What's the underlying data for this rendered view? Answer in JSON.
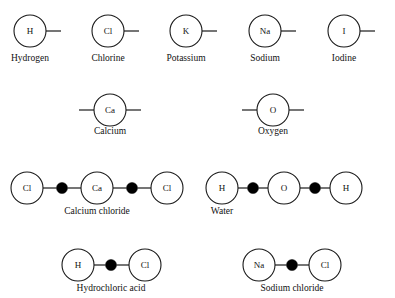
{
  "page": {
    "background_color": "#ffffff",
    "stroke_color": "#1a1a1a",
    "bond_dot_color": "#000000",
    "text_color": "#111111"
  },
  "figure": {
    "type": "chemistry-structure-diagram",
    "atom_radius": 16,
    "molecule_atom_radius": 16,
    "bond_dot_radius": 5.5
  },
  "rows": [
    {
      "row_name": "monovalent-atoms",
      "kind": "atom",
      "valence_bonds": 1,
      "y_center": 31,
      "label_y": 61,
      "items": [
        {
          "symbol": "H",
          "name": "Hydrogen",
          "cx": 30,
          "label_x": 30
        },
        {
          "symbol": "Cl",
          "name": "Chlorine",
          "cx": 108,
          "label_x": 108
        },
        {
          "symbol": "K",
          "name": "Potassium",
          "cx": 186,
          "label_x": 186
        },
        {
          "symbol": "Na",
          "name": "Sodium",
          "cx": 265,
          "label_x": 265
        },
        {
          "symbol": "I",
          "name": "Iodine",
          "cx": 344,
          "label_x": 344
        }
      ]
    },
    {
      "row_name": "divalent-atoms",
      "kind": "atom",
      "valence_bonds": 2,
      "y_center": 110,
      "label_y": 134,
      "items": [
        {
          "symbol": "Ca",
          "name": "Calcium",
          "cx": 110,
          "label_x": 110
        },
        {
          "symbol": "O",
          "name": "Oxygen",
          "cx": 273,
          "label_x": 273
        }
      ]
    }
  ],
  "molecules": [
    {
      "name": "Calcium chloride",
      "y_center": 188,
      "label_x": 97,
      "label_y": 214,
      "atoms": [
        {
          "symbol": "Cl",
          "cx": 27
        },
        {
          "symbol": "Ca",
          "cx": 97
        },
        {
          "symbol": "Cl",
          "cx": 167
        }
      ],
      "bond_dots": [
        {
          "cx": 62
        },
        {
          "cx": 132
        }
      ]
    },
    {
      "name": "Water",
      "y_center": 188,
      "label_x": 222,
      "label_y": 214,
      "atoms": [
        {
          "symbol": "H",
          "cx": 222
        },
        {
          "symbol": "O",
          "cx": 284
        },
        {
          "symbol": "H",
          "cx": 346
        }
      ],
      "bond_dots": [
        {
          "cx": 253
        },
        {
          "cx": 315
        }
      ]
    },
    {
      "name": "Hydrochloric acid",
      "y_center": 265,
      "label_x": 111,
      "label_y": 291,
      "atoms": [
        {
          "symbol": "H",
          "cx": 78
        },
        {
          "symbol": "Cl",
          "cx": 145
        }
      ],
      "bond_dots": [
        {
          "cx": 111
        }
      ]
    },
    {
      "name": "Sodium chloride",
      "y_center": 265,
      "label_x": 292,
      "label_y": 291,
      "atoms": [
        {
          "symbol": "Na",
          "cx": 259
        },
        {
          "symbol": "Cl",
          "cx": 325
        }
      ],
      "bond_dots": [
        {
          "cx": 292
        }
      ]
    }
  ]
}
